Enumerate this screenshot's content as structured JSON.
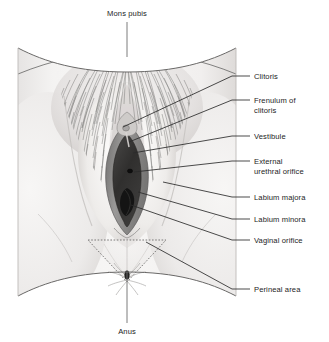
{
  "figure": {
    "background_color": "#ffffff",
    "text_color": "#1c1c1c",
    "leader_color": "#2b2b2b",
    "skin_light": "#f3f2f1",
    "skin_mid": "#e2e0df",
    "skin_shadow": "#c9c6c4",
    "labia_minora_color": "#8d8c8b",
    "vestibule_color": "#3b3a39",
    "vaginal_orifice_color": "#151515",
    "hair_color": "#6b6a69",
    "outline_color": "#6a6968"
  },
  "labels": {
    "top": {
      "text": "Mons pubis",
      "x": 127,
      "y": 16,
      "stem_from_y": 22,
      "stem_to_y": 57
    },
    "bottom": {
      "text": "Anus",
      "x": 127,
      "y": 334,
      "stem_from_y": 272,
      "stem_to_y": 323
    },
    "right": [
      {
        "id": "clitoris",
        "lines": [
          "Clitoris"
        ],
        "text_x": 254,
        "text_y": 79,
        "leader": [
          [
            250,
            76
          ],
          [
            232,
            76
          ],
          [
            123,
            127
          ]
        ]
      },
      {
        "id": "frenulum-of-clitoris",
        "lines": [
          "Frenulum of",
          "clitoris"
        ],
        "text_x": 254,
        "text_y": 103,
        "leader": [
          [
            250,
            100
          ],
          [
            232,
            100
          ],
          [
            129,
            142
          ]
        ]
      },
      {
        "id": "vestibule",
        "lines": [
          "Vestibule"
        ],
        "text_x": 254,
        "text_y": 139,
        "leader": [
          [
            250,
            136
          ],
          [
            232,
            136
          ],
          [
            133,
            153
          ]
        ]
      },
      {
        "id": "external-urethral-orifice",
        "lines": [
          "External",
          "urethral orifice"
        ],
        "text_x": 254,
        "text_y": 164,
        "leader": [
          [
            250,
            161
          ],
          [
            232,
            161
          ],
          [
            134,
            172
          ]
        ]
      },
      {
        "id": "labium-majora",
        "lines": [
          "Labium majora"
        ],
        "text_x": 254,
        "text_y": 200,
        "leader": [
          [
            250,
            197
          ],
          [
            232,
            197
          ],
          [
            163,
            182
          ]
        ]
      },
      {
        "id": "labium-minora",
        "lines": [
          "Labium minora"
        ],
        "text_x": 254,
        "text_y": 222,
        "leader": [
          [
            250,
            219
          ],
          [
            232,
            219
          ],
          [
            138,
            192
          ]
        ]
      },
      {
        "id": "vaginal-orifice",
        "lines": [
          "Vaginal orifice"
        ],
        "text_x": 254,
        "text_y": 243,
        "leader": [
          [
            250,
            240
          ],
          [
            232,
            240
          ],
          [
            131,
            205
          ]
        ]
      },
      {
        "id": "perineal-area",
        "lines": [
          "Perineal area"
        ],
        "text_x": 254,
        "text_y": 292,
        "leader": [
          [
            250,
            289
          ],
          [
            232,
            289
          ],
          [
            146,
            242
          ]
        ]
      }
    ]
  }
}
